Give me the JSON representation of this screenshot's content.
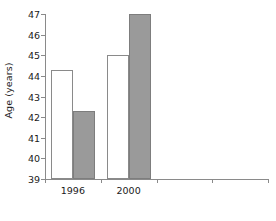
{
  "chart_data": {
    "type": "bar",
    "title": "",
    "subtitle": "",
    "xlabel": "",
    "ylabel": "Age (years)",
    "categories": [
      "1996",
      "2000",
      "",
      ""
    ],
    "series": [
      {
        "name": "white-bar",
        "color": "#ffffff",
        "values": [
          44.3,
          45.0,
          null,
          null
        ]
      },
      {
        "name": "gray-bar",
        "color": "#9a9a9a",
        "values": [
          42.3,
          47.0,
          null,
          null
        ]
      }
    ],
    "ylim": [
      39,
      47
    ],
    "y_ticks": [
      39,
      40,
      41,
      42,
      43,
      44,
      45,
      46,
      47
    ],
    "y_tick_labels": [
      "39",
      "40",
      "41",
      "42",
      "43",
      "44",
      "45",
      "46",
      "47"
    ],
    "grid": false,
    "legend": "none",
    "axis_color": "#8a8a8a",
    "text_color": "#1a1a1a",
    "background": "#ffffff"
  }
}
